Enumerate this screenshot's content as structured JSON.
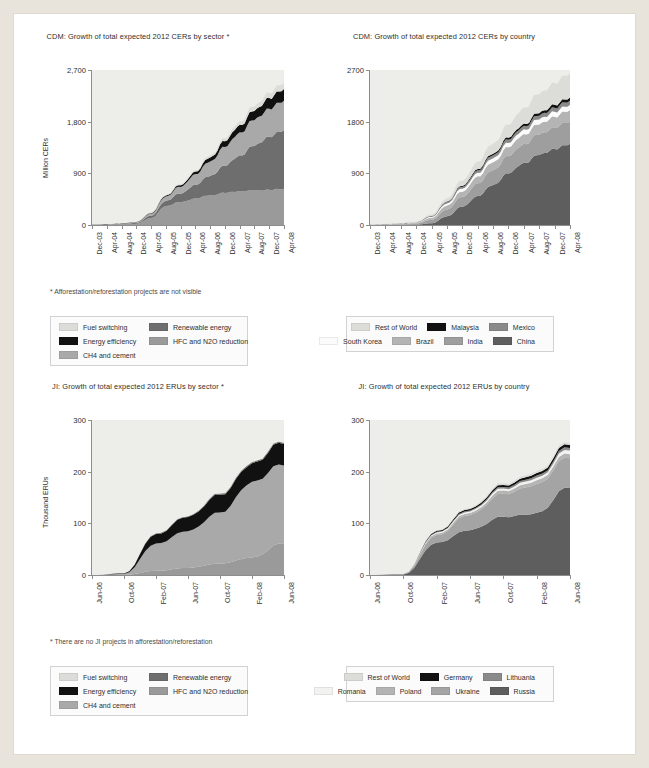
{
  "charts": [
    {
      "id": "cdm-sector",
      "title": "CDM: Growth of total expected 2012 CERs by sector *",
      "note": "* Afforestation/reforestation projects are not visible",
      "chart_data": {
        "type": "area",
        "title": "CDM: Growth of total expected 2012 CERs by sector *",
        "xlabel": "",
        "ylabel": "Million CERs",
        "ylim": [
          0,
          2700
        ],
        "yticks": [
          "0",
          "900",
          "1,800",
          "2,700"
        ],
        "ytickvals": [
          0,
          900,
          1800,
          2700
        ],
        "grid": false,
        "legend_position": "below",
        "stacked": true,
        "x": [
          "Dec-03",
          "Apr-04",
          "Aug-04",
          "Dec-04",
          "Apr-05",
          "Aug-05",
          "Dec-05",
          "Apr-06",
          "Aug-06",
          "Dec-06",
          "Apr-07",
          "Aug-07",
          "Dec-07",
          "Apr-08"
        ],
        "series": [
          {
            "name": "HFC and N2O reduction",
            "color": "#9a9a9a",
            "values": [
              5,
              8,
              12,
              20,
              120,
              330,
              400,
              460,
              520,
              560,
              590,
              600,
              615,
              625
            ]
          },
          {
            "name": "Renewable energy",
            "color": "#6e6e6e",
            "values": [
              2,
              4,
              8,
              15,
              40,
              90,
              150,
              240,
              340,
              470,
              620,
              780,
              930,
              1010
            ]
          },
          {
            "name": "CH4 and cement",
            "color": "#a9a9a9",
            "values": [
              1,
              3,
              6,
              12,
              35,
              75,
              120,
              180,
              250,
              330,
              400,
              450,
              490,
              510
            ]
          },
          {
            "name": "Energy efficiency",
            "color": "#111111",
            "values": [
              0,
              1,
              2,
              4,
              10,
              18,
              28,
              45,
              70,
              100,
              130,
              160,
              185,
              200
            ]
          },
          {
            "name": "Fuel switching",
            "color": "#dcdcd8",
            "values": [
              0,
              1,
              2,
              3,
              6,
              10,
              16,
              24,
              34,
              48,
              62,
              78,
              95,
              110
            ]
          }
        ]
      },
      "legend": [
        [
          {
            "label": "Fuel switching",
            "color": "#dcdcd8"
          },
          {
            "label": "Renewable energy",
            "color": "#6e6e6e"
          }
        ],
        [
          {
            "label": "Energy efficiency",
            "color": "#111111"
          },
          {
            "label": "HFC and N2O reduction",
            "color": "#9a9a9a"
          }
        ],
        [
          {
            "label": "CH4 and cement",
            "color": "#a9a9a9"
          }
        ]
      ]
    },
    {
      "id": "cdm-country",
      "title": "CDM: Growth of total expected 2012 CERs by country",
      "note": "",
      "chart_data": {
        "type": "area",
        "title": "CDM: Growth of total expected 2012 CERs by country",
        "xlabel": "",
        "ylabel": "",
        "ylim": [
          0,
          2700
        ],
        "yticks": [
          "0",
          "900",
          "1800",
          "2700"
        ],
        "ytickvals": [
          0,
          900,
          1800,
          2700
        ],
        "grid": false,
        "legend_position": "below",
        "stacked": true,
        "x": [
          "Dec-03",
          "Apr-04",
          "Aug-04",
          "Dec-04",
          "Apr-05",
          "Aug-05",
          "Dec-05",
          "Apr-06",
          "Aug-06",
          "Dec-06",
          "Apr-07",
          "Aug-07",
          "Dec-07",
          "Apr-08"
        ],
        "series": [
          {
            "name": "China",
            "color": "#5e5e5e",
            "values": [
              0,
              2,
              4,
              8,
              30,
              150,
              320,
              500,
              700,
              900,
              1080,
              1220,
              1330,
              1400
            ]
          },
          {
            "name": "India",
            "color": "#9e9e9e",
            "values": [
              3,
              6,
              10,
              18,
              60,
              120,
              170,
              220,
              260,
              300,
              330,
              355,
              375,
              390
            ]
          },
          {
            "name": "Brazil",
            "color": "#b4b4b4",
            "values": [
              2,
              4,
              7,
              12,
              35,
              70,
              95,
              120,
              140,
              155,
              170,
              180,
              190,
              195
            ]
          },
          {
            "name": "South Korea",
            "color": "#fbfbfb",
            "values": [
              1,
              2,
              3,
              5,
              15,
              35,
              50,
              60,
              68,
              75,
              80,
              84,
              88,
              90
            ]
          },
          {
            "name": "Mexico",
            "color": "#8a8a8a",
            "values": [
              1,
              2,
              3,
              5,
              12,
              25,
              35,
              45,
              52,
              58,
              63,
              67,
              70,
              72
            ]
          },
          {
            "name": "Malaysia",
            "color": "#111111",
            "values": [
              0,
              1,
              1,
              2,
              5,
              10,
              16,
              22,
              28,
              34,
              40,
              45,
              50,
              53
            ]
          },
          {
            "name": "Rest of World",
            "color": "#dcdcd8",
            "values": [
              1,
              3,
              5,
              9,
              25,
              55,
              90,
              130,
              175,
              225,
              280,
              330,
              380,
              420
            ]
          }
        ]
      },
      "legend": [
        [
          {
            "label": "Rest of World",
            "color": "#dcdcd8"
          },
          {
            "label": "Malaysia",
            "color": "#111111"
          },
          {
            "label": "Mexico",
            "color": "#8a8a8a"
          }
        ],
        [
          {
            "label": "South Korea",
            "color": "#fbfbfb"
          },
          {
            "label": "Brazil",
            "color": "#b4b4b4"
          },
          {
            "label": "India",
            "color": "#9e9e9e"
          },
          {
            "label": "China",
            "color": "#5e5e5e"
          }
        ]
      ]
    },
    {
      "id": "ji-sector",
      "title": "JI: Growth of total expected 2012 ERUs by sector *",
      "note": "* There are no JI projects in afforestation/reforestation",
      "chart_data": {
        "type": "area",
        "title": "JI: Growth of total expected 2012 ERUs by sector *",
        "xlabel": "",
        "ylabel": "Thousand ERUs",
        "ylim": [
          0,
          300
        ],
        "yticks": [
          "0",
          "100",
          "200",
          "300"
        ],
        "ytickvals": [
          0,
          100,
          200,
          300
        ],
        "grid": false,
        "legend_position": "below",
        "stacked": true,
        "x": [
          "Jun-06",
          "Oct-06",
          "Feb-07",
          "Jun-07",
          "Oct-07",
          "Feb-08",
          "Jun-08"
        ],
        "series": [
          {
            "name": "HFC and N2O reduction",
            "color": "#9a9a9a",
            "values": [
              0,
              0,
              8,
              14,
              22,
              34,
              62
            ]
          },
          {
            "name": "CH4 and cement",
            "color": "#a9a9a9",
            "values": [
              0,
              2,
              52,
              72,
              98,
              146,
              152
            ]
          },
          {
            "name": "Energy efficiency",
            "color": "#111111",
            "values": [
              0,
              1,
              18,
              28,
              34,
              36,
              42
            ]
          },
          {
            "name": "Renewable energy",
            "color": "#6e6e6e",
            "values": [
              0,
              0,
              1,
              1,
              2,
              2,
              2
            ]
          },
          {
            "name": "Fuel switching",
            "color": "#dcdcd8",
            "values": [
              0,
              0,
              0,
              0,
              0,
              0,
              0
            ]
          }
        ]
      },
      "legend": [
        [
          {
            "label": "Fuel switching",
            "color": "#dcdcd8"
          },
          {
            "label": "Renewable energy",
            "color": "#6e6e6e"
          }
        ],
        [
          {
            "label": "Energy efficiency",
            "color": "#111111"
          },
          {
            "label": "HFC and N2O reduction",
            "color": "#9a9a9a"
          }
        ],
        [
          {
            "label": "CH4 and cement",
            "color": "#a9a9a9"
          }
        ]
      ]
    },
    {
      "id": "ji-country",
      "title": "JI: Growth of total expected 2012 ERUs by country",
      "note": "",
      "chart_data": {
        "type": "area",
        "title": "JI: Growth of total expected 2012 ERUs by country",
        "xlabel": "",
        "ylabel": "",
        "ylim": [
          0,
          300
        ],
        "yticks": [
          "0",
          "100",
          "200",
          "300"
        ],
        "ytickvals": [
          0,
          100,
          200,
          300
        ],
        "grid": false,
        "legend_position": "below",
        "stacked": true,
        "x": [
          "Jun-06",
          "Oct-06",
          "Feb-07",
          "Jun-07",
          "Oct-07",
          "Feb-08",
          "Jun-08"
        ],
        "series": [
          {
            "name": "Russia",
            "color": "#5e5e5e",
            "values": [
              0,
              1,
              62,
              88,
              112,
              120,
              170
            ]
          },
          {
            "name": "Ukraine",
            "color": "#a4a4a4",
            "values": [
              0,
              1,
              14,
              30,
              44,
              56,
              58
            ]
          },
          {
            "name": "Poland",
            "color": "#b4b4b4",
            "values": [
              0,
              0,
              3,
              4,
              6,
              7,
              8
            ]
          },
          {
            "name": "Romania",
            "color": "#f2f2f0",
            "values": [
              0,
              0,
              2,
              3,
              4,
              5,
              7
            ]
          },
          {
            "name": "Lithuania",
            "color": "#8a8a8a",
            "values": [
              0,
              0,
              1,
              2,
              3,
              4,
              5
            ]
          },
          {
            "name": "Germany",
            "color": "#111111",
            "values": [
              0,
              0,
              2,
              3,
              4,
              5,
              6
            ]
          },
          {
            "name": "Rest of World",
            "color": "#dcdcd8",
            "values": [
              0,
              0,
              1,
              2,
              3,
              4,
              4
            ]
          }
        ]
      },
      "legend": [
        [
          {
            "label": "Rest of World",
            "color": "#dcdcd8"
          },
          {
            "label": "Germany",
            "color": "#111111"
          },
          {
            "label": "Lithuania",
            "color": "#8a8a8a"
          }
        ],
        [
          {
            "label": "Romania",
            "color": "#f2f2f0"
          },
          {
            "label": "Poland",
            "color": "#b4b4b4"
          },
          {
            "label": "Ukraine",
            "color": "#a4a4a4"
          },
          {
            "label": "Russia",
            "color": "#5e5e5e"
          }
        ]
      ]
    }
  ]
}
